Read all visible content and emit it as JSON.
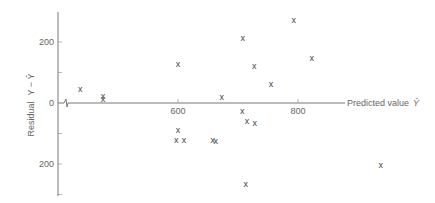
{
  "chart_data": {
    "type": "scatter",
    "title": "",
    "xlabel": "Predicted value Ŷ",
    "ylabel": "Residual  Y − Ŷ",
    "x_ticks": [
      600,
      800
    ],
    "y_ticks": [
      200,
      0,
      -200
    ],
    "y_tick_labels": [
      "200",
      "0",
      "200"
    ],
    "x_tick_labels": [
      "600",
      "800"
    ],
    "xlim": [
      340,
      1000
    ],
    "ylim": [
      -310,
      300
    ],
    "axis_break": true,
    "grid": false,
    "marker": "x",
    "points": [
      {
        "x": 437,
        "y": 46
      },
      {
        "x": 475,
        "y": 23
      },
      {
        "x": 475,
        "y": 13
      },
      {
        "x": 600,
        "y": 128
      },
      {
        "x": 600,
        "y": -89
      },
      {
        "x": 597,
        "y": -121
      },
      {
        "x": 610,
        "y": -121
      },
      {
        "x": 658,
        "y": -121
      },
      {
        "x": 663,
        "y": -125
      },
      {
        "x": 673,
        "y": 20
      },
      {
        "x": 707,
        "y": -26
      },
      {
        "x": 708,
        "y": 213
      },
      {
        "x": 715,
        "y": -59
      },
      {
        "x": 728,
        "y": -66
      },
      {
        "x": 713,
        "y": -266
      },
      {
        "x": 727,
        "y": 121
      },
      {
        "x": 755,
        "y": 62
      },
      {
        "x": 793,
        "y": 272
      },
      {
        "x": 823,
        "y": 148
      },
      {
        "x": 938,
        "y": -203
      }
    ]
  },
  "labels": {
    "ylabel_text": "Residual",
    "ylabel_expr": "Y − Ŷ",
    "xlabel_text": "Predicted value",
    "xlabel_symbol": "Ŷ",
    "marker_glyph": "x"
  }
}
